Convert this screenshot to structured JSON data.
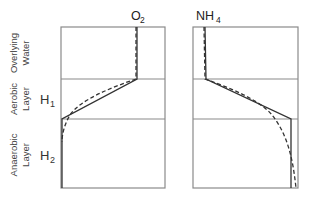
{
  "diagram": {
    "layers": [
      {
        "line1": "Overlying",
        "line2": "Water"
      },
      {
        "line1": "Aerobic",
        "line2": "Layer"
      },
      {
        "line1": "Anaerobic",
        "line2": "Layer"
      }
    ],
    "thickness_labels": [
      {
        "base": "H",
        "sub": "1"
      },
      {
        "base": "H",
        "sub": "2"
      }
    ],
    "panels": [
      {
        "title_base": "O",
        "title_sub": "2"
      },
      {
        "title_base": "NH",
        "title_sub": "4"
      }
    ],
    "colors": {
      "frame": "#8a8a8a",
      "curve": "#333333",
      "text": "#333333"
    },
    "legend_styles": [
      "solid",
      "dashed"
    ]
  }
}
